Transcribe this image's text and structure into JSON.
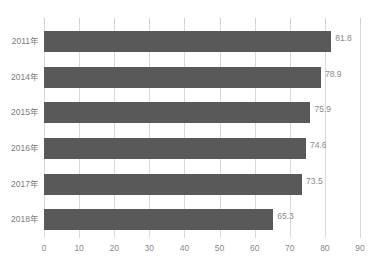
{
  "chart_data": {
    "type": "bar",
    "orientation": "horizontal",
    "title": "",
    "title_visible": false,
    "xlabel": "",
    "ylabel": "",
    "categories": [
      "2011年",
      "2014年",
      "2015年",
      "2016年",
      "2017年",
      "2018年"
    ],
    "values": [
      81.8,
      78.9,
      75.9,
      74.6,
      73.5,
      65.3
    ],
    "value_labels": [
      "81.8",
      "78.9",
      "75.9",
      "74.6",
      "73.5",
      "65.3"
    ],
    "xlim": [
      0,
      90
    ],
    "xticks": [
      0,
      10,
      20,
      30,
      40,
      50,
      60,
      70,
      80,
      90
    ],
    "xtick_labels": [
      "0",
      "10",
      "20",
      "30",
      "40",
      "50",
      "60",
      "70",
      "80",
      "90"
    ],
    "grid": "vertical",
    "legend": null,
    "legend_position": "none",
    "series": [
      {
        "name": "",
        "values": [
          81.8,
          78.9,
          75.9,
          74.6,
          73.5,
          65.3
        ]
      }
    ]
  },
  "colors": {
    "bar_fill": "#595959",
    "gridline": "#d9d9d9",
    "tick_mark": "#d0d0d0",
    "value_label_text": "#8a8a8a",
    "category_label_text": "#7d7d7d",
    "axis_label_text": "#8a8a8a",
    "background": "#ffffff"
  }
}
